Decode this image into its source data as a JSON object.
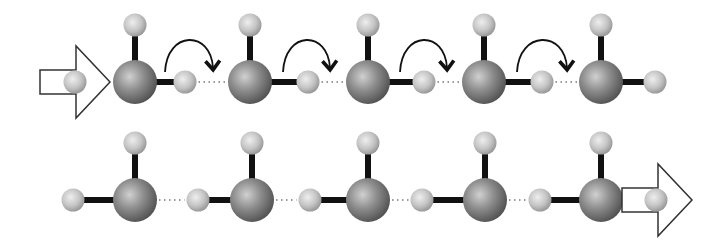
{
  "diagram": {
    "colors": {
      "background": "#ffffff",
      "oxygen": "#8a8a8a",
      "hydrogen": "#c8c8c8",
      "bond": "#111111",
      "arrow_outline": "#333333",
      "hbond_dots": "#777777"
    },
    "rows": [
      {
        "id": "before",
        "center_y": 82,
        "input_arrow": {
          "x1": 40,
          "x2": 110,
          "proton_x": 75
        },
        "molecules": [
          {
            "o_x": 135,
            "side_h_x": 185,
            "side": "right"
          },
          {
            "o_x": 250,
            "side_h_x": 308,
            "side": "right"
          },
          {
            "o_x": 368,
            "side_h_x": 424,
            "side": "right"
          },
          {
            "o_x": 484,
            "side_h_x": 542,
            "side": "right"
          },
          {
            "o_x": 601,
            "side_h_x": 655,
            "side": "right"
          }
        ],
        "curved_arrows": [
          {
            "from_x": 165,
            "to_x": 213
          },
          {
            "from_x": 283,
            "to_x": 330
          },
          {
            "from_x": 400,
            "to_x": 447
          },
          {
            "from_x": 517,
            "to_x": 567
          }
        ]
      },
      {
        "id": "after",
        "center_y": 200,
        "output_arrow": {
          "x1": 622,
          "x2": 692,
          "proton_x": 656
        },
        "molecules": [
          {
            "o_x": 135,
            "side_h_x": 73,
            "side": "left"
          },
          {
            "o_x": 252,
            "side_h_x": 198,
            "side": "left"
          },
          {
            "o_x": 368,
            "side_h_x": 310,
            "side": "left"
          },
          {
            "o_x": 485,
            "side_h_x": 422,
            "side": "left"
          },
          {
            "o_x": 601,
            "side_h_x": 540,
            "side": "left"
          }
        ]
      }
    ]
  }
}
